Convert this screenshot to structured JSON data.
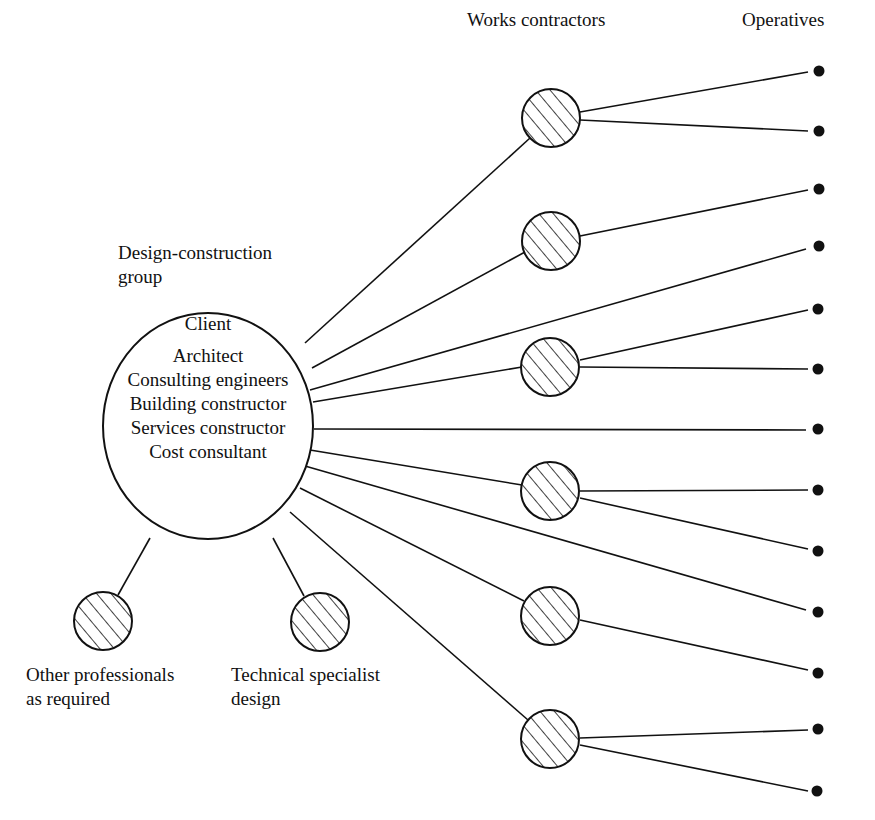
{
  "headers": {
    "works_contractors": "Works contractors",
    "operatives": "Operatives"
  },
  "group_label": {
    "line1": "Design-construction",
    "line2": "group"
  },
  "client_circle": {
    "title": "Client",
    "members": [
      "Architect",
      "Consulting engineers",
      "Building constructor",
      "Services constructor",
      "Cost consultant"
    ]
  },
  "bottom_nodes": [
    {
      "line1": "Other professionals",
      "line2": "as required"
    },
    {
      "line1": "Technical specialist",
      "line2": "design"
    }
  ],
  "colors": {
    "stroke": "#111111",
    "background": "#ffffff"
  },
  "structure": {
    "works_contractor_count": 6,
    "operative_count": 13,
    "direct_client_to_operatives": [
      4,
      7,
      10
    ],
    "contractor_to_operatives": {
      "1": [
        1,
        2
      ],
      "2": [
        3
      ],
      "3": [
        5,
        6
      ],
      "4": [
        8,
        9
      ],
      "5": [
        11
      ],
      "6": [
        12,
        13
      ]
    }
  }
}
